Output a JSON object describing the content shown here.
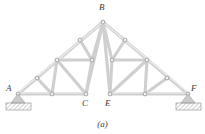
{
  "figure": {
    "caption": "(a)",
    "type": "truss-structure-diagram"
  },
  "colors": {
    "member_fill": "#d9d9d9",
    "member_edge": "#b4b4b4",
    "joint_ring": "#8c8c8c",
    "joint_fill": "#f2f2f2",
    "support_fill": "#c8c8c8",
    "support_hatch": "#9a9a9a",
    "label_text": "#3a3a3a",
    "background": "#ffffff"
  },
  "labels": {
    "A": {
      "text": "A",
      "x": 6,
      "y": 84
    },
    "B": {
      "text": "B",
      "x": 99,
      "y": 4
    },
    "C": {
      "text": "C",
      "x": 82,
      "y": 100
    },
    "E": {
      "text": "E",
      "x": 104,
      "y": 100
    },
    "F": {
      "text": "F",
      "x": 191,
      "y": 84
    }
  },
  "joints": [
    {
      "name": "A",
      "x": 18,
      "y": 94
    },
    {
      "name": "C",
      "x": 86,
      "y": 94
    },
    {
      "name": "E",
      "x": 110,
      "y": 94
    },
    {
      "name": "F",
      "x": 188,
      "y": 94
    },
    {
      "name": "B",
      "x": 103,
      "y": 22
    },
    {
      "name": "j-bottom-left-mid",
      "x": 52,
      "y": 94
    },
    {
      "name": "j-bottom-right-mid",
      "x": 145,
      "y": 94
    },
    {
      "name": "j-left-chord-low",
      "x": 37,
      "y": 78
    },
    {
      "name": "j-left-chord-mid",
      "x": 57,
      "y": 60
    },
    {
      "name": "j-left-chord-high",
      "x": 80,
      "y": 40
    },
    {
      "name": "j-left-inner",
      "x": 92,
      "y": 60
    },
    {
      "name": "j-right-inner",
      "x": 112,
      "y": 60
    },
    {
      "name": "j-right-chord-high",
      "x": 125,
      "y": 40
    },
    {
      "name": "j-right-chord-mid",
      "x": 147,
      "y": 60
    },
    {
      "name": "j-right-chord-low",
      "x": 167,
      "y": 78
    }
  ],
  "members": [
    {
      "name": "bottom-chord-A-to-C",
      "from": "A",
      "to": "C"
    },
    {
      "name": "bottom-chord-E-to-F",
      "from": "E",
      "to": "F"
    },
    {
      "name": "top-chord-A-to-B-left",
      "from": "A",
      "to": "B"
    },
    {
      "name": "top-chord-B-to-F-right",
      "from": "B",
      "to": "F"
    },
    {
      "name": "web-left-lower-diagonal",
      "from": "j-left-chord-low",
      "to": "j-bottom-left-mid"
    },
    {
      "name": "web-left-vertical",
      "from": "j-left-chord-mid",
      "to": "j-bottom-left-mid"
    },
    {
      "name": "web-left-horizontal-tie",
      "from": "j-left-chord-mid",
      "to": "j-left-inner"
    },
    {
      "name": "web-left-diagonal-to-C",
      "from": "j-left-chord-mid",
      "to": "C"
    },
    {
      "name": "web-left-upper-diagonal",
      "from": "j-left-chord-high",
      "to": "j-left-inner"
    },
    {
      "name": "web-left-inner-to-C",
      "from": "j-left-inner",
      "to": "C"
    },
    {
      "name": "web-B-to-C",
      "from": "B",
      "to": "C"
    },
    {
      "name": "web-B-to-left-inner",
      "from": "B",
      "to": "j-left-inner"
    },
    {
      "name": "web-B-to-E",
      "from": "B",
      "to": "E"
    },
    {
      "name": "web-B-to-right-inner",
      "from": "B",
      "to": "j-right-inner"
    },
    {
      "name": "web-right-inner-to-E",
      "from": "j-right-inner",
      "to": "E"
    },
    {
      "name": "web-right-upper-diagonal",
      "from": "j-right-chord-high",
      "to": "j-right-inner"
    },
    {
      "name": "web-right-horizontal-tie",
      "from": "j-right-inner",
      "to": "j-right-chord-mid"
    },
    {
      "name": "web-right-diagonal-to-E",
      "from": "j-right-chord-mid",
      "to": "E"
    },
    {
      "name": "web-right-vertical",
      "from": "j-right-chord-mid",
      "to": "j-bottom-right-mid"
    },
    {
      "name": "web-right-lower-diagonal",
      "from": "j-right-chord-low",
      "to": "j-bottom-right-mid"
    }
  ],
  "supports": [
    {
      "name": "support-A",
      "joint": "A",
      "x": 18,
      "y": 94,
      "kind": "pin-hatched"
    },
    {
      "name": "support-F",
      "joint": "F",
      "x": 188,
      "y": 94,
      "kind": "pin-hatched"
    }
  ]
}
